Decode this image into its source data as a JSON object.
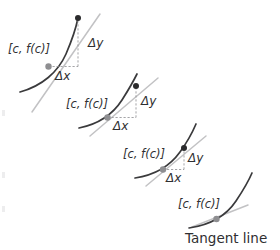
{
  "figure": {
    "background_color": "#ffffff",
    "curve_color": "#3a3a3c",
    "secant_color": "#c2c2c4",
    "leg_color": "#9a9a9d",
    "point_dark_color": "#2b2b2d",
    "point_grey_color": "#8e8e91",
    "text_color": "#2f2f31"
  },
  "panels": [
    {
      "id": "panel-1",
      "point_label": "[c, f(c)]",
      "delta_y_label": "Δy",
      "delta_x_label": "Δx",
      "curve": "M 20 92 C 42 86, 58 72, 66 54 C 72 40, 76 28, 78 18",
      "secant": "M 32 112 L 100 14",
      "point_tangent": {
        "x": 48.5,
        "y": 66.5
      },
      "point_secondary": {
        "x": 78,
        "y": 18
      },
      "leg_horizontal": "M 48.5 66.5 L 78 66.5",
      "leg_vertical": "M 78 66.5 L 78 18",
      "point_label_pos": {
        "x": 8,
        "y": 53
      },
      "delta_y_pos": {
        "x": 88,
        "y": 47
      },
      "delta_x_pos": {
        "x": 55,
        "y": 80
      }
    },
    {
      "id": "panel-2",
      "point_label": "[c, f(c)]",
      "delta_y_label": "Δy",
      "delta_x_label": "Δx",
      "curve": "M 79 128 C 99 124, 113 114, 122 100 C 129 89, 134 80, 137 74",
      "secant": "M 90 136 L 158 78",
      "point_tangent": {
        "x": 107.5,
        "y": 117.5
      },
      "point_secondary": {
        "x": 136,
        "y": 86
      },
      "leg_horizontal": "M 107.5 117.5 L 136 117.5",
      "leg_vertical": "M 136 117.5 L 136 86",
      "point_label_pos": {
        "x": 66,
        "y": 108
      },
      "delta_y_pos": {
        "x": 141,
        "y": 105
      },
      "delta_x_pos": {
        "x": 113,
        "y": 130
      }
    },
    {
      "id": "panel-3",
      "point_label": "[c, f(c)]",
      "delta_y_label": "Δy",
      "delta_x_label": "Δx",
      "curve": "M 135 178 C 155 175, 170 166, 180 152 C 188 141, 193 131, 196 124",
      "secant": "M 146 186 L 206 136",
      "point_tangent": {
        "x": 163,
        "y": 169.5
      },
      "point_secondary": {
        "x": 184,
        "y": 148
      },
      "leg_horizontal": "M 163 169.5 L 184 169.5",
      "leg_vertical": "M 184 169.5 L 184 148",
      "point_label_pos": {
        "x": 123,
        "y": 158
      },
      "delta_y_pos": {
        "x": 188,
        "y": 162
      },
      "delta_x_pos": {
        "x": 166,
        "y": 182
      }
    },
    {
      "id": "panel-4",
      "point_label": "[c, f(c)]",
      "tangent_label": "Tangent line",
      "curve": "M 189 228 C 210 225, 226 216, 236 201 C 244 189, 249 180, 252 173",
      "tangent": "M 192 227 L 248 205",
      "point_tangent": {
        "x": 216.5,
        "y": 219
      },
      "point_label_pos": {
        "x": 178,
        "y": 208
      },
      "tangent_label_pos": {
        "x": 185,
        "y": 243
      }
    }
  ]
}
